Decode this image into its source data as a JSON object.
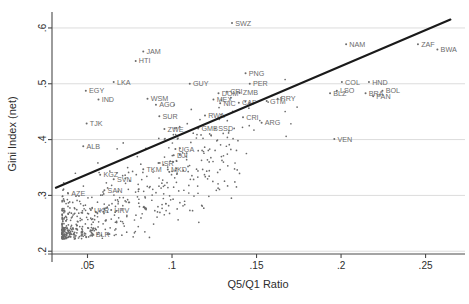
{
  "chart_data": {
    "type": "scatter",
    "title": "",
    "xlabel": "Q5/Q1 Ratio",
    "ylabel": "Gini Index (net)",
    "xlim": [
      0.029,
      0.268
    ],
    "ylim": [
      0.195,
      0.625
    ],
    "xticks": [
      0.05,
      0.1,
      0.15,
      0.2,
      0.25
    ],
    "xtick_labels": [
      ".05",
      ".1",
      ".15",
      ".2",
      ".25"
    ],
    "yticks": [
      0.2,
      0.3,
      0.4,
      0.5,
      0.6
    ],
    "ytick_labels": [
      ".2",
      ".3",
      ".4",
      ".5",
      ".6"
    ],
    "grid": "horizontal",
    "legend": "none",
    "marker_color": "#6b6b6b",
    "label_color": "#6b6b6b",
    "fit_line_color": "#1a1a1a",
    "fit_line": {
      "x0": 0.0313,
      "y0": 0.3137,
      "x1": 0.2647,
      "y1": 0.615
    },
    "labeled_points": [
      {
        "code": "SWZ",
        "x": 0.1355,
        "y": 0.609
      },
      {
        "code": "NAM",
        "x": 0.203,
        "y": 0.571
      },
      {
        "code": "ZAF",
        "x": 0.2455,
        "y": 0.571
      },
      {
        "code": "BWA",
        "x": 0.257,
        "y": 0.5615
      },
      {
        "code": "JAM",
        "x": 0.083,
        "y": 0.558
      },
      {
        "code": "HTI",
        "x": 0.0785,
        "y": 0.541
      },
      {
        "code": "PNG",
        "x": 0.1435,
        "y": 0.519
      },
      {
        "code": "COL",
        "x": 0.2005,
        "y": 0.503
      },
      {
        "code": "HND",
        "x": 0.2165,
        "y": 0.503
      },
      {
        "code": "LKA",
        "x": 0.0655,
        "y": 0.503
      },
      {
        "code": "GUY",
        "x": 0.1105,
        "y": 0.5
      },
      {
        "code": "PER",
        "x": 0.146,
        "y": 0.5
      },
      {
        "code": "LSO",
        "x": 0.1975,
        "y": 0.4875
      },
      {
        "code": "BOL",
        "x": 0.2245,
        "y": 0.4875
      },
      {
        "code": "BLZ",
        "x": 0.1935,
        "y": 0.483
      },
      {
        "code": "BRA",
        "x": 0.2145,
        "y": 0.483
      },
      {
        "code": "PAN",
        "x": 0.219,
        "y": 0.4775
      },
      {
        "code": "EGY",
        "x": 0.049,
        "y": 0.4875
      },
      {
        "code": "DOM",
        "x": 0.1275,
        "y": 0.483
      },
      {
        "code": "CRI",
        "x": 0.1325,
        "y": 0.4855
      },
      {
        "code": "ZMB",
        "x": 0.14,
        "y": 0.484
      },
      {
        "code": "IND",
        "x": 0.0565,
        "y": 0.472
      },
      {
        "code": "WSM",
        "x": 0.0855,
        "y": 0.473
      },
      {
        "code": "MEX",
        "x": 0.1245,
        "y": 0.472
      },
      {
        "code": "CAF",
        "x": 0.1395,
        "y": 0.466
      },
      {
        "code": "NIC",
        "x": 0.1285,
        "y": 0.465
      },
      {
        "code": "GTM",
        "x": 0.156,
        "y": 0.469
      },
      {
        "code": "PRY",
        "x": 0.1625,
        "y": 0.473
      },
      {
        "code": "AGO",
        "x": 0.0905,
        "y": 0.4625
      },
      {
        "code": "SUR",
        "x": 0.0925,
        "y": 0.442
      },
      {
        "code": "RWA",
        "x": 0.1195,
        "y": 0.443
      },
      {
        "code": "CRI2",
        "x": 0.142,
        "y": 0.44
      },
      {
        "code": "TJK",
        "x": 0.0495,
        "y": 0.429
      },
      {
        "code": "ARG",
        "x": 0.153,
        "y": 0.43
      },
      {
        "code": "ZWE",
        "x": 0.0955,
        "y": 0.419
      },
      {
        "code": "GMB",
        "x": 0.1155,
        "y": 0.42
      },
      {
        "code": "SSD",
        "x": 0.1255,
        "y": 0.42
      },
      {
        "code": "VEN",
        "x": 0.196,
        "y": 0.401
      },
      {
        "code": "ALB",
        "x": 0.0475,
        "y": 0.388
      },
      {
        "code": "UGA",
        "x": 0.102,
        "y": 0.383
      },
      {
        "code": "DJI",
        "x": 0.101,
        "y": 0.372
      },
      {
        "code": "ISR",
        "x": 0.092,
        "y": 0.358
      },
      {
        "code": "TKM",
        "x": 0.083,
        "y": 0.347
      },
      {
        "code": "MKD",
        "x": 0.0975,
        "y": 0.3465
      },
      {
        "code": "KGZ",
        "x": 0.0575,
        "y": 0.337
      },
      {
        "code": "SVN",
        "x": 0.0655,
        "y": 0.329
      },
      {
        "code": "AZE",
        "x": 0.0385,
        "y": 0.3035
      },
      {
        "code": "SAN",
        "x": 0.06,
        "y": 0.309
      },
      {
        "code": "UKR",
        "x": 0.052,
        "y": 0.274
      },
      {
        "code": "HRV",
        "x": 0.064,
        "y": 0.274
      },
      {
        "code": "BLR",
        "x": 0.053,
        "y": 0.231
      }
    ],
    "n_points_approx": 560
  },
  "axes": {
    "xlabel": "Q5/Q1 Ratio",
    "ylabel": "Gini Index (net)"
  }
}
